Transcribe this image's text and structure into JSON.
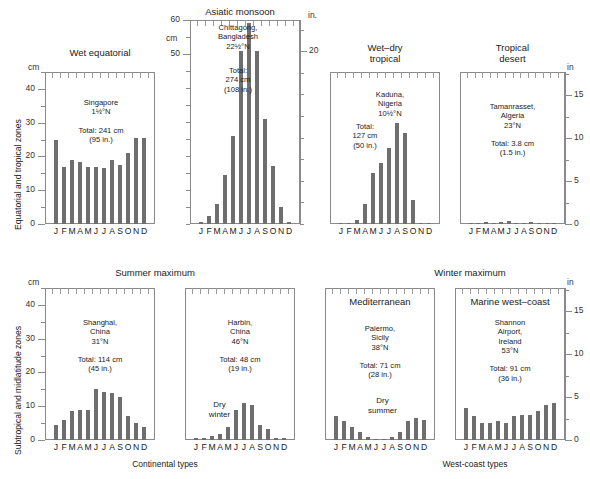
{
  "figure": {
    "row1_axis_label": "Equatorial and tropical zones",
    "row2_axis_label": "Subtropical and midlatitude zones",
    "unit_cm": "cm",
    "unit_in_dot": "in.",
    "unit_in": "in",
    "caption_left": "Continental types",
    "caption_right": "West-coast types",
    "bar_color": "#6e6e6e",
    "frame_color": "#8a8a8a",
    "months": [
      "J",
      "F",
      "M",
      "A",
      "M",
      "J",
      "J",
      "A",
      "S",
      "O",
      "N",
      "D"
    ]
  },
  "group_titles": {
    "asiatic_monsoon": "Asiatic monsoon",
    "summer_maximum": "Summer maximum",
    "winter_maximum": "Winter maximum"
  },
  "axes": {
    "cm_45": {
      "ticks": [
        0,
        10,
        20,
        30,
        40
      ],
      "max": 45
    },
    "cm_60": {
      "ticks": [
        50,
        60
      ],
      "max": 60
    },
    "in_17": {
      "ticks": [
        0,
        5,
        10,
        15
      ],
      "max": 17.7
    },
    "in_23": {
      "ticks": [
        20
      ],
      "max": 23.6
    }
  },
  "chart_data": [
    {
      "id": "wet-equatorial",
      "type": "bar",
      "title": "Wet equatorial",
      "station": "Singapore",
      "latitude": "1½°N",
      "total_cm": "Total: 241 cm",
      "total_in": "(95 in.)",
      "note": "Singapore\n1½°N\n\nTotal: 241 cm\n(95 in.)",
      "categories": [
        "J",
        "F",
        "M",
        "A",
        "M",
        "J",
        "J",
        "A",
        "S",
        "O",
        "N",
        "D"
      ],
      "values": [
        25.0,
        17.0,
        19.0,
        18.5,
        17.0,
        17.0,
        16.5,
        19.0,
        17.5,
        21.0,
        25.5,
        25.5
      ],
      "ylabel": "cm",
      "ylim": [
        0,
        45
      ]
    },
    {
      "id": "asiatic-monsoon",
      "type": "bar",
      "title": "Asiatic monsoon",
      "station": "Chittagong,\nBangladesh",
      "latitude": "22½°N",
      "total_cm": "274 cm",
      "total_in": "(108 in.)",
      "note": "Chittagong,\nBangladesh\n22½°N",
      "note2": "Total:\n274 cm\n(108 in.)",
      "categories": [
        "J",
        "F",
        "M",
        "A",
        "M",
        "J",
        "J",
        "A",
        "S",
        "O",
        "N",
        "D"
      ],
      "values": [
        0.5,
        2.5,
        6.0,
        14.5,
        26.0,
        51.0,
        59.0,
        51.0,
        31.0,
        17.0,
        5.0,
        0.6
      ],
      "ylabel": "cm",
      "ylim": [
        0,
        60
      ]
    },
    {
      "id": "wet-dry-tropical",
      "type": "bar",
      "title": "Wet–dry\ntropical",
      "station": "Kaduna,\nNigeria",
      "latitude": "10½°N",
      "total_cm": "127 cm",
      "total_in": "(50 in.)",
      "note": "Kaduna,\nNigeria\n10½°N",
      "note2": "Total:\n127 cm\n(50 in.)",
      "categories": [
        "J",
        "F",
        "M",
        "A",
        "M",
        "J",
        "J",
        "A",
        "S",
        "O",
        "N",
        "D"
      ],
      "values": [
        0.3,
        0.3,
        1.2,
        6.0,
        15.0,
        18.0,
        22.5,
        30.0,
        27.0,
        7.0,
        0.3,
        0.3
      ],
      "ylabel": "cm",
      "ylim": [
        0,
        45
      ]
    },
    {
      "id": "tropical-desert",
      "type": "bar",
      "title": "Tropical\ndesert",
      "station": "Tamanrasset,\nAlgeria",
      "latitude": "23°N",
      "total_cm": "Total: 3.8 cm",
      "total_in": "(1.5 in.)",
      "note": "Tamanrasset,\nAlgeria\n23°N\n\nTotal: 3.8 cm\n(1.5 in.)",
      "categories": [
        "J",
        "F",
        "M",
        "A",
        "M",
        "J",
        "J",
        "A",
        "S",
        "O",
        "N",
        "D"
      ],
      "values": [
        0.4,
        0.4,
        0.5,
        0.3,
        0.5,
        0.8,
        0.2,
        0.4,
        0.7,
        0.4,
        0.4,
        0.3
      ],
      "ylabel": "in",
      "ylim": [
        0,
        45
      ]
    },
    {
      "id": "continental-summer-max",
      "type": "bar",
      "title": "Summer maximum",
      "station": "Shanghai,\nChina",
      "latitude": "31°N",
      "total_cm": "Total: 114 cm",
      "total_in": "(45 in.)",
      "note": "Shanghai,\nChina\n31°N\n\nTotal: 114 cm\n(45 in.)",
      "categories": [
        "J",
        "F",
        "M",
        "A",
        "M",
        "J",
        "J",
        "A",
        "S",
        "O",
        "N",
        "D"
      ],
      "values": [
        4.5,
        6.0,
        8.5,
        9.0,
        9.0,
        15.0,
        14.3,
        14.0,
        12.8,
        7.0,
        5.0,
        4.0
      ],
      "ylabel": "cm",
      "ylim": [
        0,
        45
      ]
    },
    {
      "id": "continental-dry-winter",
      "type": "bar",
      "title": "Summer maximum",
      "station": "Harbin,\nChina",
      "latitude": "46°N",
      "total_cm": "Total: 48 cm",
      "total_in": "(19 in.)",
      "note": "Harbin,\nChina\n46°N\n\nTotal: 48 cm\n(19 in.)",
      "annotation": "Dry\nwinter",
      "categories": [
        "J",
        "F",
        "M",
        "A",
        "M",
        "J",
        "J",
        "A",
        "S",
        "O",
        "N",
        "D"
      ],
      "values": [
        0.5,
        0.5,
        1.1,
        1.9,
        4.0,
        9.0,
        11.0,
        10.3,
        4.5,
        3.2,
        0.7,
        0.7
      ],
      "ylabel": "cm",
      "ylim": [
        0,
        45
      ]
    },
    {
      "id": "mediterranean",
      "type": "bar",
      "title": "Mediterranean",
      "station": "Palermo,\nSicily",
      "latitude": "38°N",
      "total_cm": "Total: 71 cm",
      "total_in": "(28 in.)",
      "note": "Palermo,\nSicily\n38°N\n\nTotal: 71 cm\n(28 in.)",
      "annotation": "Dry\nsummer",
      "categories": [
        "J",
        "F",
        "M",
        "A",
        "M",
        "J",
        "J",
        "A",
        "S",
        "O",
        "N",
        "D"
      ],
      "values": [
        7.0,
        5.5,
        4.0,
        2.5,
        1.0,
        0.4,
        0.3,
        1.0,
        2.5,
        5.5,
        6.5,
        6.0
      ],
      "ylabel": "in",
      "ylim": [
        0,
        45
      ]
    },
    {
      "id": "marine-west-coast",
      "type": "bar",
      "title": "Marine west–coast",
      "station": "Shannon\nAirport,\nIreland",
      "latitude": "53°N",
      "total_cm": "Total: 91 cm",
      "total_in": "(36 in.)",
      "note": "Shannon\nAirport,\nIreland\n53°N\n\nTotal: 91 cm\n(36 in.)",
      "categories": [
        "J",
        "F",
        "M",
        "A",
        "M",
        "J",
        "J",
        "A",
        "S",
        "O",
        "N",
        "D"
      ],
      "values": [
        9.5,
        7.0,
        5.0,
        5.0,
        5.5,
        5.0,
        7.0,
        7.5,
        7.5,
        8.5,
        10.5,
        11.0
      ],
      "ylabel": "in",
      "ylim": [
        0,
        45
      ]
    }
  ]
}
